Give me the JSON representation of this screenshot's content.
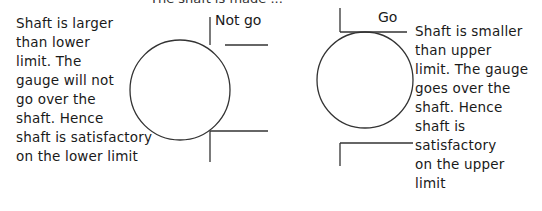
{
  "title": "The shaft is made ...",
  "left": {
    "gauge_label": "Not go",
    "lines": [
      "Shaft is larger",
      "than lower",
      "limit. The",
      "gauge will not",
      "go over the",
      "shaft. Hence",
      "shaft is satisfactory",
      "on the lower limit"
    ]
  },
  "right": {
    "gauge_label": "Go",
    "lines": [
      "Shaft is smaller",
      "than upper",
      "limit. The gauge",
      "goes over the",
      "shaft. Hence",
      "shaft is",
      "satisfactory",
      "on the upper",
      "limit"
    ]
  },
  "colors": {
    "stroke": "#333333",
    "text": "#1a1a1a"
  }
}
